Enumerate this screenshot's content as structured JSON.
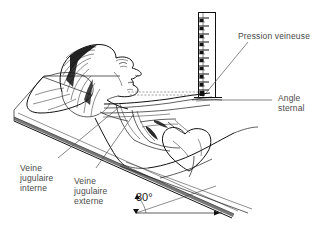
{
  "figure": {
    "language": "fr",
    "background_color": "#ffffff",
    "ink_color": "#111111",
    "label_color": "#4a4a4a"
  },
  "labels": {
    "pression_veineuse": "Pression veineuse",
    "angle_sternal_line1": "Angle",
    "angle_sternal_line2": "sternal",
    "veine_jugulaire_interne_line1": "Veine",
    "veine_jugulaire_interne_line2": "jugulaire",
    "veine_jugulaire_interne_line3": "interne",
    "veine_jugulaire_externe_line1": "Veine",
    "veine_jugulaire_externe_line2": "jugulaire",
    "veine_jugulaire_externe_line3": "externe",
    "bed_angle": "30°"
  },
  "manometer": {
    "name": "vertical-ruler",
    "major_tick_count": 11,
    "minor_tick_count": 10,
    "orientation": "vertical",
    "units": "cm"
  },
  "anatomy": {
    "parts": [
      "head-profile",
      "hair",
      "pillow",
      "bed-platform",
      "neck",
      "shoulder",
      "torso",
      "heart",
      "internal-jugular-vein",
      "external-jugular-vein",
      "sternal-angle"
    ]
  },
  "annotations": {
    "reference_line": "dashed-horizontal-from-sternal-angle",
    "angle_arc_value": "30°"
  }
}
